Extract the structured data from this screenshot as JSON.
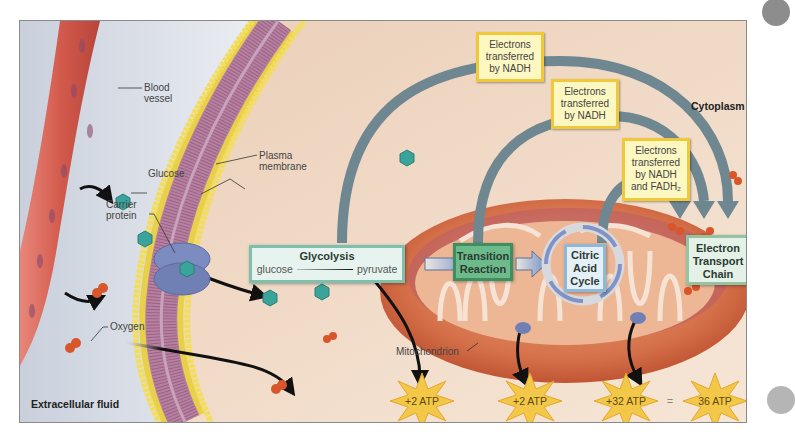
{
  "figure": {
    "regions": {
      "extracellular": "Extracellular fluid",
      "cytoplasm": "Cytoplasm"
    },
    "labels": {
      "blood_vessel_1": "Blood",
      "blood_vessel_2": "vessel",
      "glucose": "Glucose",
      "plasma_membrane_1": "Plasma",
      "plasma_membrane_2": "membrane",
      "carrier_protein_1": "Carrier",
      "carrier_protein_2": "protein",
      "oxygen": "Oxygen",
      "mitochondrion": "Mitochondrion"
    },
    "electron_boxes": [
      {
        "line1": "Electrons",
        "line2": "transferred",
        "line3": "by NADH",
        "line4": ""
      },
      {
        "line1": "Electrons",
        "line2": "transferred",
        "line3": "by NADH",
        "line4": ""
      },
      {
        "line1": "Electrons",
        "line2": "transferred",
        "line3": "by NADH",
        "line4": "and FADH₂"
      }
    ],
    "steps": {
      "glycolysis": {
        "title": "Glycolysis",
        "from": "glucose",
        "to": "pyruvate"
      },
      "transition": {
        "line1": "Transition",
        "line2": "Reaction"
      },
      "citric": {
        "line1": "Citric",
        "line2": "Acid",
        "line3": "Cycle"
      },
      "etc": {
        "line1": "Electron",
        "line2": "Transport",
        "line3": "Chain"
      }
    },
    "atp": {
      "glycolysis": "+2 ATP",
      "citric": "+2 ATP",
      "etc": "+32 ATP",
      "equals": "=",
      "total": "36 ATP"
    },
    "colors": {
      "background_cytoplasm": "#f2d9c4",
      "background_extracellular": "#dfe4ec",
      "arrow_gray": "#6f8791",
      "glucose_teal": "#3aa39a",
      "oxygen_orange": "#d9562a",
      "atp_star": "#f3c747",
      "yellow_box_border": "#f0c93a"
    }
  }
}
